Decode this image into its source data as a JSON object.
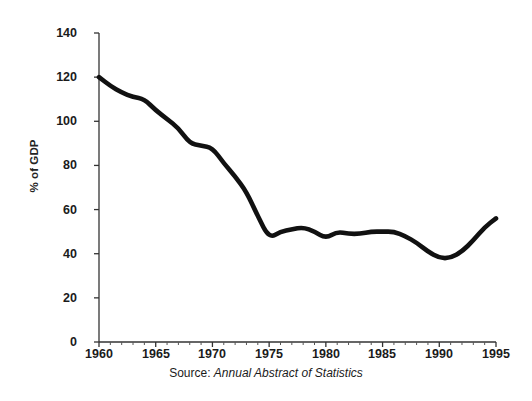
{
  "chart_data": {
    "type": "line",
    "title": "",
    "subtitle": "",
    "xlabel": "",
    "ylabel": "% of GDP",
    "source_prefix": "Source:",
    "source_title": "Annual Abstract of Statistics",
    "grid": false,
    "legend": "none",
    "line_color": "#111111",
    "axis_color": "#333333",
    "background": "#ffffff",
    "xlim": [
      1960,
      1995
    ],
    "ylim": [
      0,
      140
    ],
    "yticks": [
      0,
      20,
      40,
      60,
      80,
      100,
      120,
      140
    ],
    "ytick_labels": [
      "0",
      "20",
      "40",
      "60",
      "80",
      "100",
      "120",
      "140"
    ],
    "xticks": [
      1960,
      1965,
      1970,
      1975,
      1980,
      1985,
      1990,
      1995
    ],
    "xtick_labels": [
      "1960",
      "1965",
      "1970",
      "1975",
      "1980",
      "1985",
      "1990",
      "1995"
    ],
    "x_minor_tick_interval": 1,
    "series": [
      {
        "name": "Public sector debt",
        "x": [
          1960,
          1961,
          1962,
          1963,
          1964,
          1965,
          1966,
          1967,
          1968,
          1969,
          1970,
          1971,
          1972,
          1973,
          1974,
          1975,
          1976,
          1977,
          1978,
          1979,
          1980,
          1981,
          1982,
          1983,
          1984,
          1985,
          1986,
          1987,
          1988,
          1989,
          1990,
          1991,
          1992,
          1993,
          1994,
          1995
        ],
        "values": [
          120,
          116,
          113,
          111,
          110,
          105,
          101,
          97,
          90,
          89,
          88,
          81,
          75,
          68,
          57,
          47,
          50,
          51,
          52,
          50,
          47,
          50,
          49,
          49,
          50,
          50,
          50,
          48,
          45,
          41,
          38,
          38,
          41,
          46,
          52,
          56
        ]
      }
    ]
  }
}
